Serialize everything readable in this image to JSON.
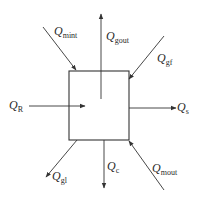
{
  "diagram": {
    "title": "",
    "colors": {
      "stroke": "#333333",
      "text": "#2a2a2a",
      "background": "#ffffff"
    },
    "box": {
      "x": 69,
      "y": 71,
      "width": 60,
      "height": 69,
      "label": ""
    },
    "flows": [
      {
        "id": "mint",
        "symbol": "Q",
        "subscript": "mint",
        "direction": "in",
        "from": [
          43,
          27
        ],
        "to": [
          76,
          70
        ],
        "label_pos": [
          54,
          25
        ]
      },
      {
        "id": "gout",
        "symbol": "Q",
        "subscript": "gout",
        "direction": "out",
        "from": [
          101,
          99
        ],
        "to": [
          101,
          14
        ],
        "label_pos": [
          106,
          30
        ]
      },
      {
        "id": "gf",
        "symbol": "Q",
        "subscript": "gf",
        "direction": "in",
        "from": [
          164,
          36
        ],
        "to": [
          129,
          79
        ],
        "label_pos": [
          157,
          52
        ]
      },
      {
        "id": "R",
        "symbol": "Q",
        "subscript": "R",
        "direction": "in",
        "from": [
          29,
          106
        ],
        "to": [
          85,
          106
        ],
        "label_pos": [
          9,
          99
        ]
      },
      {
        "id": "s",
        "symbol": "Q",
        "subscript": "s",
        "direction": "out",
        "from": [
          129,
          108
        ],
        "to": [
          176,
          108
        ],
        "label_pos": [
          177,
          101
        ]
      },
      {
        "id": "gl",
        "symbol": "Q",
        "subscript": "gl",
        "direction": "out",
        "from": [
          77,
          140
        ],
        "to": [
          46,
          177
        ],
        "label_pos": [
          52,
          170
        ]
      },
      {
        "id": "c",
        "symbol": "Q",
        "subscript": "c",
        "direction": "out",
        "from": [
          104,
          140
        ],
        "to": [
          104,
          188
        ],
        "label_pos": [
          107,
          160
        ]
      },
      {
        "id": "mout",
        "symbol": "Q",
        "subscript": "mout",
        "direction": "in",
        "from": [
          164,
          190
        ],
        "to": [
          129,
          141
        ],
        "label_pos": [
          152,
          162
        ]
      }
    ]
  }
}
